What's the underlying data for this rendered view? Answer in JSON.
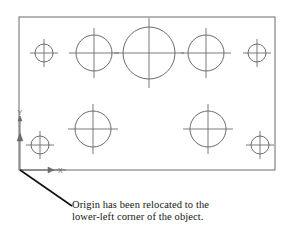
{
  "drawing": {
    "title": "Object plate with bolt-hole pattern",
    "stroke_color": "#6b6b6b",
    "accent_color": "#111111",
    "background_color": "#ffffff",
    "plate": {
      "name": "object-outline-rectangle",
      "x": 19,
      "y": 17,
      "width": 256,
      "height": 153
    },
    "holes": [
      {
        "id": "hole-top-1",
        "cx": 44,
        "cy": 53,
        "r": 9,
        "row": "top",
        "size": "small"
      },
      {
        "id": "hole-top-2",
        "cx": 94,
        "cy": 53,
        "r": 18,
        "row": "top",
        "size": "medium"
      },
      {
        "id": "hole-top-3",
        "cx": 149,
        "cy": 53,
        "r": 26,
        "row": "top",
        "size": "large"
      },
      {
        "id": "hole-top-4",
        "cx": 206,
        "cy": 53,
        "r": 18,
        "row": "top",
        "size": "medium"
      },
      {
        "id": "hole-top-5",
        "cx": 257,
        "cy": 53,
        "r": 9,
        "row": "top",
        "size": "small"
      },
      {
        "id": "hole-bot-1",
        "cx": 40,
        "cy": 145,
        "r": 9,
        "row": "bottom",
        "size": "small"
      },
      {
        "id": "hole-bot-2",
        "cx": 93,
        "cy": 129,
        "r": 18,
        "row": "bottom",
        "size": "medium"
      },
      {
        "id": "hole-bot-3",
        "cx": 208,
        "cy": 129,
        "r": 18,
        "row": "bottom",
        "size": "medium"
      },
      {
        "id": "hole-bot-4",
        "cx": 260,
        "cy": 145,
        "r": 9,
        "row": "bottom",
        "size": "small"
      }
    ],
    "ucs_icon": {
      "name": "ucs-origin-icon",
      "origin_x": 20,
      "origin_y": 170,
      "y_axis_label": "Y",
      "x_axis_label": "X",
      "y_axis_length": 54,
      "x_axis_length": 46
    },
    "leader": {
      "name": "leader-line",
      "x1": 20,
      "y1": 170,
      "x2": 72,
      "y2": 206
    }
  },
  "caption": {
    "name": "origin-caption",
    "line1": "Origin has been relocated to the",
    "line2": "lower-left corner of the object."
  }
}
